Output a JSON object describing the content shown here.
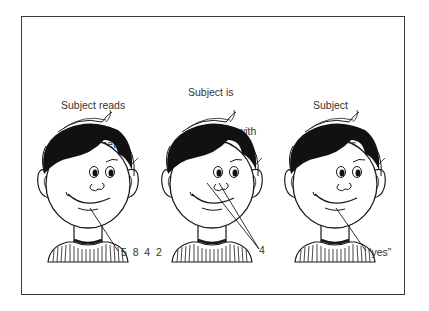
{
  "figure": {
    "panels": [
      {
        "caption_lines": [
          "Subject reads",
          "memory set,",
          "e.g., 5  8  4  2"
        ],
        "pointer_label": "5  8  4  2",
        "pointer_target": "mouth"
      },
      {
        "caption_lines": [
          "Subject is",
          "presented with",
          "test item,",
          "e.g., 4"
        ],
        "pointer_label": "4",
        "pointer_target": "eyes"
      },
      {
        "caption_lines": [
          "Subject",
          "responds,",
          "e.g., “yes.”"
        ],
        "pointer_label": "“yes”",
        "pointer_target": "mouth"
      }
    ],
    "colors": {
      "ink": "#1a1a1a",
      "text": "#333333",
      "frame": "#3a3a3a",
      "background": "#ffffff"
    }
  }
}
